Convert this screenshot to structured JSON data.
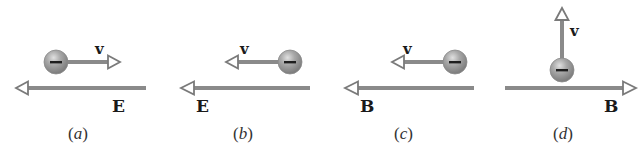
{
  "figure": {
    "panels": [
      {
        "id": "a",
        "label": "(a)",
        "letter": "a",
        "particle": {
          "charge": "negative",
          "sign": "−"
        },
        "velocity": {
          "label": "v",
          "direction": "right"
        },
        "field": {
          "label": "E",
          "type": "electric",
          "direction": "left"
        }
      },
      {
        "id": "b",
        "label": "(b)",
        "letter": "b",
        "particle": {
          "charge": "negative",
          "sign": "−"
        },
        "velocity": {
          "label": "v",
          "direction": "left"
        },
        "field": {
          "label": "E",
          "type": "electric",
          "direction": "left"
        }
      },
      {
        "id": "c",
        "label": "(c)",
        "letter": "c",
        "particle": {
          "charge": "negative",
          "sign": "−"
        },
        "velocity": {
          "label": "v",
          "direction": "left"
        },
        "field": {
          "label": "B",
          "type": "magnetic",
          "direction": "left"
        }
      },
      {
        "id": "d",
        "label": "(d)",
        "letter": "d",
        "particle": {
          "charge": "negative",
          "sign": "−"
        },
        "velocity": {
          "label": "v",
          "direction": "up"
        },
        "field": {
          "label": "B",
          "type": "magnetic",
          "direction": "right"
        }
      }
    ],
    "colors": {
      "arrow_shaft": "#8a8a8a",
      "arrow_head_outline": "#7a7a7a",
      "particle_fill": "#9c9c9c",
      "particle_highlight": "#d4d4d4",
      "text": "#1a1a1a"
    }
  }
}
